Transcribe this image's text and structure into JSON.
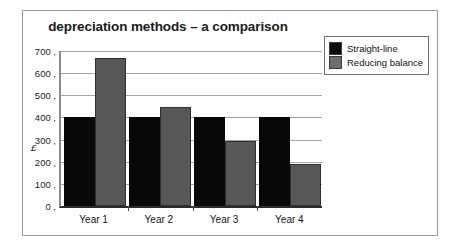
{
  "chart_data": {
    "type": "bar",
    "title": "depreciation methods – a comparison",
    "xlabel": "",
    "ylabel": "£",
    "categories": [
      "Year 1",
      "Year 2",
      "Year 3",
      "Year 4"
    ],
    "series": [
      {
        "name": "Straight-line",
        "color": "#080808",
        "values": [
          400,
          400,
          400,
          400
        ]
      },
      {
        "name": "Reducing balance",
        "color": "#575757",
        "values": [
          667,
          445,
          295,
          190
        ]
      }
    ],
    "ylim": [
      0,
      700
    ],
    "ytick_step": 100,
    "yticks": [
      "700",
      "600",
      "500",
      "400",
      "300",
      "200",
      "100",
      "0"
    ],
    "ytick_values": [
      700,
      600,
      500,
      400,
      300,
      200,
      100,
      0
    ],
    "grid": "horizontal",
    "legend_position": "top-right",
    "background_color": "#ffffff",
    "frame_color": "#9a9a9a",
    "gridline_color": "#a6a6a6"
  }
}
